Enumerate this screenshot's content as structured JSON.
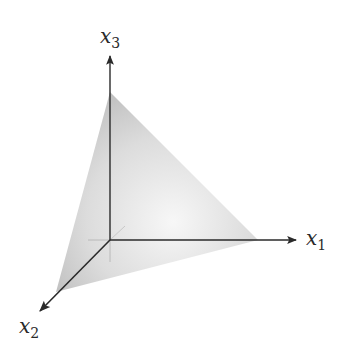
{
  "diagram": {
    "title": "",
    "axes": {
      "x1": {
        "base": "x",
        "sub": "1"
      },
      "x2": {
        "base": "x",
        "sub": "2"
      },
      "x3": {
        "base": "x",
        "sub": "3"
      }
    },
    "colors": {
      "axis": "#2a2a2a",
      "face_light": "#f2f2f2",
      "face_dark": "#bdbdbd",
      "hidden_line": "#b0b0b0"
    }
  }
}
